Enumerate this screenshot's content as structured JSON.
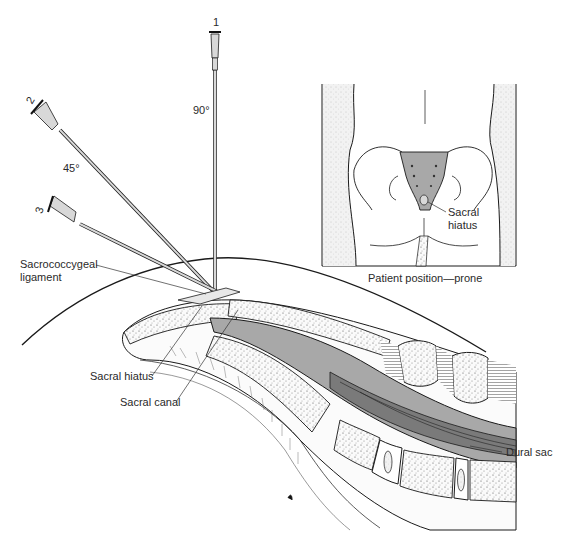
{
  "figure": {
    "needles": [
      {
        "number": "1",
        "angle": "90°"
      },
      {
        "number": "2",
        "angle": "45°"
      },
      {
        "number": "3",
        "angle": ""
      }
    ],
    "labels": {
      "sacrococcygeal_ligament": "Sacrococcygeal\nligament",
      "sacral_hiatus": "Sacral hiatus",
      "sacral_canal": "Sacral canal",
      "dural_sac": "Dural sac"
    },
    "inset": {
      "label_sacral_hiatus": "Sacral\nhiatus",
      "caption": "Patient position—prone"
    },
    "colors": {
      "line": "#1a1a1a",
      "fill_gray": "#a8a8a8",
      "fill_dark": "#7a7a7a",
      "needle_fill": "#d8d8d8",
      "bone_fill": "#f4f4f4"
    }
  }
}
